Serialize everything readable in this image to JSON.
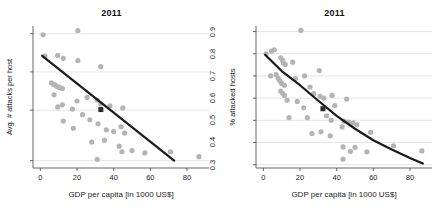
{
  "figure": {
    "width": 446,
    "height": 217,
    "background": "#ffffff",
    "point_color": "#b4b4b4",
    "highlight_color": "#2b2b2b",
    "trend_color": "#1a1a1a",
    "grid_color": "#d8d8d8",
    "axis_color": "#555555"
  },
  "chart_data": [
    {
      "type": "scatter",
      "title": "2011",
      "xlabel": "GDP per capita [in 1000 US$]",
      "ylabel": "Avg. # attacks per host",
      "xlim": [
        -4,
        92
      ],
      "ylim": [
        1.75,
        23
      ],
      "yscale": "log",
      "xticks": [
        0,
        20,
        40,
        60,
        80
      ],
      "xticklabels": [
        "0",
        "20",
        "40",
        "60",
        "80"
      ],
      "yticks": [
        2,
        5,
        10,
        20
      ],
      "yticklabels": [
        "2",
        "5",
        "10",
        "20"
      ],
      "grid": "horizontal",
      "legend": "none",
      "points": [
        {
          "x": 1.5,
          "y": 19.6
        },
        {
          "x": 20.5,
          "y": 21.2
        },
        {
          "x": 2.5,
          "y": 13.3
        },
        {
          "x": 9.5,
          "y": 13.5
        },
        {
          "x": 12.5,
          "y": 12.8
        },
        {
          "x": 20.5,
          "y": 12.3
        },
        {
          "x": 33.0,
          "y": 11.0
        },
        {
          "x": 6.0,
          "y": 8.2
        },
        {
          "x": 7.0,
          "y": 8.0
        },
        {
          "x": 8.0,
          "y": 7.9
        },
        {
          "x": 9.0,
          "y": 7.7
        },
        {
          "x": 10.0,
          "y": 7.6
        },
        {
          "x": 11.0,
          "y": 7.5
        },
        {
          "x": 12.0,
          "y": 7.4
        },
        {
          "x": 7.5,
          "y": 6.6
        },
        {
          "x": 12.0,
          "y": 5.5
        },
        {
          "x": 20.0,
          "y": 5.9
        },
        {
          "x": 25.5,
          "y": 6.3
        },
        {
          "x": 31.0,
          "y": 6.0
        },
        {
          "x": 9.5,
          "y": 5.3
        },
        {
          "x": 17.5,
          "y": 5.1
        },
        {
          "x": 33.0,
          "y": 5.6
        },
        {
          "x": 38.0,
          "y": 5.4
        },
        {
          "x": 45.0,
          "y": 5.2
        },
        {
          "x": 23.0,
          "y": 4.6
        },
        {
          "x": 12.5,
          "y": 4.1
        },
        {
          "x": 18.0,
          "y": 3.6
        },
        {
          "x": 27.0,
          "y": 4.2
        },
        {
          "x": 31.5,
          "y": 3.9
        },
        {
          "x": 36.0,
          "y": 3.5
        },
        {
          "x": 40.0,
          "y": 3.4
        },
        {
          "x": 44.0,
          "y": 3.7
        },
        {
          "x": 46.0,
          "y": 3.3
        },
        {
          "x": 28.0,
          "y": 2.8
        },
        {
          "x": 35.0,
          "y": 2.9
        },
        {
          "x": 43.0,
          "y": 2.6
        },
        {
          "x": 44.5,
          "y": 2.35
        },
        {
          "x": 50.0,
          "y": 2.4
        },
        {
          "x": 57.0,
          "y": 2.3
        },
        {
          "x": 71.0,
          "y": 2.35
        },
        {
          "x": 86.5,
          "y": 2.15
        },
        {
          "x": 31.0,
          "y": 2.05
        }
      ],
      "highlight_point": {
        "x": 33.0,
        "y": 5.05
      },
      "trend": {
        "kind": "linear-on-log",
        "x_start": 1.0,
        "y_start": 13.4,
        "x_end": 73.0,
        "y_end": 2.0
      }
    },
    {
      "type": "scatter",
      "title": "2011",
      "xlabel": "GDP per capita [in 1000 US$]",
      "ylabel": "% attacked hosts",
      "xlim": [
        -4,
        92
      ],
      "ylim": [
        0.285,
        0.925
      ],
      "yscale": "linear",
      "xticks": [
        0,
        20,
        40,
        60,
        80
      ],
      "xticklabels": [
        "0",
        "20",
        "40",
        "60",
        "80"
      ],
      "yticks": [
        0.3,
        0.4,
        0.5,
        0.6,
        0.7,
        0.8,
        0.9
      ],
      "yticklabels": [
        "0.3",
        "0.4",
        "0.5",
        "0.6",
        "0.7",
        "0.8",
        "0.9"
      ],
      "grid": "horizontal",
      "legend": "none",
      "points": [
        {
          "x": 20.5,
          "y": 0.905
        },
        {
          "x": 1.5,
          "y": 0.8
        },
        {
          "x": 4.5,
          "y": 0.812
        },
        {
          "x": 6.0,
          "y": 0.818
        },
        {
          "x": 9.5,
          "y": 0.782
        },
        {
          "x": 10.5,
          "y": 0.77
        },
        {
          "x": 11.0,
          "y": 0.758
        },
        {
          "x": 12.0,
          "y": 0.752
        },
        {
          "x": 16.0,
          "y": 0.762
        },
        {
          "x": 4.0,
          "y": 0.7
        },
        {
          "x": 7.0,
          "y": 0.706
        },
        {
          "x": 8.0,
          "y": 0.69
        },
        {
          "x": 9.0,
          "y": 0.678
        },
        {
          "x": 10.0,
          "y": 0.666
        },
        {
          "x": 11.5,
          "y": 0.658
        },
        {
          "x": 17.5,
          "y": 0.688
        },
        {
          "x": 30.5,
          "y": 0.724
        },
        {
          "x": 22.5,
          "y": 0.7
        },
        {
          "x": 9.5,
          "y": 0.632
        },
        {
          "x": 10.5,
          "y": 0.622
        },
        {
          "x": 11.5,
          "y": 0.612
        },
        {
          "x": 13.0,
          "y": 0.59
        },
        {
          "x": 25.5,
          "y": 0.65
        },
        {
          "x": 27.5,
          "y": 0.62
        },
        {
          "x": 31.0,
          "y": 0.608
        },
        {
          "x": 33.0,
          "y": 0.6
        },
        {
          "x": 37.5,
          "y": 0.612
        },
        {
          "x": 45.5,
          "y": 0.596
        },
        {
          "x": 18.5,
          "y": 0.585
        },
        {
          "x": 22.0,
          "y": 0.556
        },
        {
          "x": 39.0,
          "y": 0.566
        },
        {
          "x": 14.0,
          "y": 0.512
        },
        {
          "x": 24.0,
          "y": 0.512
        },
        {
          "x": 34.5,
          "y": 0.52
        },
        {
          "x": 37.0,
          "y": 0.5
        },
        {
          "x": 44.0,
          "y": 0.496
        },
        {
          "x": 46.5,
          "y": 0.492
        },
        {
          "x": 49.0,
          "y": 0.488
        },
        {
          "x": 51.0,
          "y": 0.48
        },
        {
          "x": 43.0,
          "y": 0.47
        },
        {
          "x": 26.5,
          "y": 0.44
        },
        {
          "x": 31.5,
          "y": 0.448
        },
        {
          "x": 36.5,
          "y": 0.43
        },
        {
          "x": 58.5,
          "y": 0.446
        },
        {
          "x": 43.5,
          "y": 0.38
        },
        {
          "x": 50.0,
          "y": 0.378
        },
        {
          "x": 71.0,
          "y": 0.385
        },
        {
          "x": 47.5,
          "y": 0.36
        },
        {
          "x": 56.5,
          "y": 0.358
        },
        {
          "x": 86.5,
          "y": 0.362
        },
        {
          "x": 43.5,
          "y": 0.325
        }
      ],
      "highlight_point": {
        "x": 32.5,
        "y": 0.552
      },
      "trend": {
        "kind": "curve",
        "path": [
          {
            "x": 1.0,
            "y": 0.795
          },
          {
            "x": 10.0,
            "y": 0.722
          },
          {
            "x": 20.0,
            "y": 0.658
          },
          {
            "x": 30.0,
            "y": 0.588
          },
          {
            "x": 40.0,
            "y": 0.52
          },
          {
            "x": 50.0,
            "y": 0.462
          },
          {
            "x": 60.0,
            "y": 0.41
          },
          {
            "x": 70.0,
            "y": 0.368
          },
          {
            "x": 80.0,
            "y": 0.33
          },
          {
            "x": 87.0,
            "y": 0.305
          }
        ]
      }
    }
  ]
}
